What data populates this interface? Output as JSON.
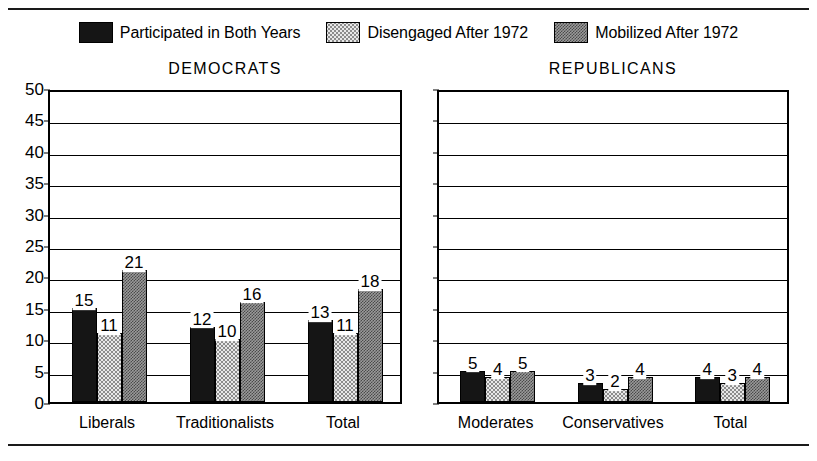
{
  "legend": {
    "items": [
      {
        "label": "Participated in Both Years",
        "pattern": "solid",
        "swatch_name": "legend-swatch-participated"
      },
      {
        "label": "Disengaged After 1972",
        "pattern": "stipple",
        "swatch_name": "legend-swatch-disengaged"
      },
      {
        "label": "Mobilized After 1972",
        "pattern": "checker",
        "swatch_name": "legend-swatch-mobilized"
      }
    ]
  },
  "chart_data": {
    "type": "bar",
    "title": "",
    "xlabel": "",
    "ylabel": "",
    "ylim": [
      0,
      50
    ],
    "ytick_step": 5,
    "yticks": [
      "0",
      "5",
      "10",
      "15",
      "20",
      "25",
      "30",
      "35",
      "40",
      "45",
      "50"
    ],
    "grid": true,
    "legend_position": "top",
    "series_names": [
      "Participated in Both Years",
      "Disengaged After 1972",
      "Mobilized After 1972"
    ],
    "panels": [
      {
        "title": "DEMOCRATS",
        "show_yaxis_labels": true,
        "categories": [
          "Liberals",
          "Traditionalists",
          "Total"
        ],
        "series": [
          {
            "name": "Participated in Both Years",
            "values": [
              15,
              12,
              13
            ]
          },
          {
            "name": "Disengaged After 1972",
            "values": [
              11,
              10,
              11
            ]
          },
          {
            "name": "Mobilized After 1972",
            "values": [
              21,
              16,
              18
            ]
          }
        ]
      },
      {
        "title": "REPUBLICANS",
        "show_yaxis_labels": false,
        "categories": [
          "Moderates",
          "Conservatives",
          "Total"
        ],
        "series": [
          {
            "name": "Participated in Both Years",
            "values": [
              5,
              3,
              4
            ]
          },
          {
            "name": "Disengaged After 1972",
            "values": [
              4,
              2,
              3
            ]
          },
          {
            "name": "Mobilized After 1972",
            "values": [
              5,
              4,
              4
            ]
          }
        ]
      }
    ]
  },
  "colors": {
    "ink": "#000000",
    "solid_fill": "#151515",
    "stipple_fill": "#e8e8e8",
    "checker_fill": "#9a9a9a",
    "background": "#ffffff"
  }
}
